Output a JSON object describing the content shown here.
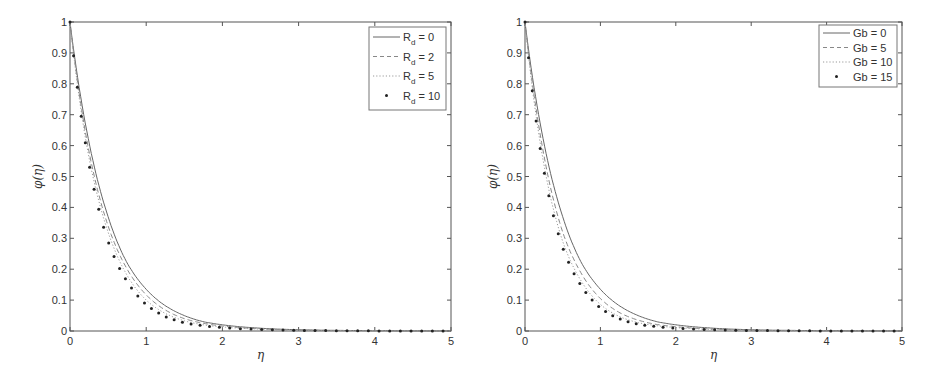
{
  "chart_data": [
    {
      "type": "line",
      "title": "",
      "xlabel": "η",
      "ylabel": "φ(η)",
      "xlim": [
        0,
        5
      ],
      "ylim": [
        0,
        1
      ],
      "xticks": [
        "0",
        "1",
        "2",
        "3",
        "4",
        "5"
      ],
      "yticks": [
        "0",
        "0.1",
        "0.2",
        "0.3",
        "0.4",
        "0.5",
        "0.6",
        "0.7",
        "0.8",
        "0.9",
        "1"
      ],
      "grid": false,
      "legend_position": "upper right",
      "x": [
        0,
        0.25,
        0.5,
        0.75,
        1,
        1.25,
        1.5,
        1.75,
        2,
        2.5,
        3,
        3.5,
        4,
        4.5,
        5
      ],
      "series": [
        {
          "name": "R_d = 0",
          "label_main": "R",
          "label_sub": "d",
          "label_rest": " = 0",
          "style": "solid",
          "values": [
            1,
            0.61,
            0.37,
            0.22,
            0.135,
            0.082,
            0.05,
            0.03,
            0.02,
            0.009,
            0.004,
            0.002,
            0.001,
            0.0005,
            0.0002
          ]
        },
        {
          "name": "R_d = 2",
          "label_main": "R",
          "label_sub": "d",
          "label_rest": " = 2",
          "style": "dashed",
          "values": [
            1,
            0.58,
            0.34,
            0.2,
            0.117,
            0.068,
            0.04,
            0.025,
            0.016,
            0.007,
            0.003,
            0.0015,
            0.0007,
            0.0003,
            0.0001
          ]
        },
        {
          "name": "R_d = 5",
          "label_main": "R",
          "label_sub": "d",
          "label_rest": " = 5",
          "style": "dotted",
          "values": [
            1,
            0.56,
            0.32,
            0.18,
            0.1,
            0.057,
            0.033,
            0.02,
            0.013,
            0.006,
            0.0025,
            0.0012,
            0.0005,
            0.0002,
            0.0001
          ]
        },
        {
          "name": "R_d = 10",
          "label_main": "R",
          "label_sub": "d",
          "label_rest": " = 10",
          "style": "markers",
          "values": [
            1,
            0.54,
            0.29,
            0.16,
            0.086,
            0.047,
            0.027,
            0.017,
            0.011,
            0.005,
            0.002,
            0.001,
            0.0004,
            0.0002,
            0.0001
          ]
        }
      ]
    },
    {
      "type": "line",
      "title": "",
      "xlabel": "η",
      "ylabel": "φ(η)",
      "xlim": [
        0,
        5
      ],
      "ylim": [
        0,
        1
      ],
      "xticks": [
        "0",
        "1",
        "2",
        "3",
        "4",
        "5"
      ],
      "yticks": [
        "0",
        "0.1",
        "0.2",
        "0.3",
        "0.4",
        "0.5",
        "0.6",
        "0.7",
        "0.8",
        "0.9",
        "1"
      ],
      "grid": false,
      "legend_position": "upper right",
      "x": [
        0,
        0.25,
        0.5,
        0.75,
        1,
        1.25,
        1.5,
        1.75,
        2,
        2.5,
        3,
        3.5,
        4,
        4.5,
        5
      ],
      "series": [
        {
          "name": "Gb = 0",
          "label_main": "Gb = 0",
          "label_sub": "",
          "label_rest": "",
          "style": "solid",
          "values": [
            1,
            0.61,
            0.37,
            0.22,
            0.135,
            0.082,
            0.05,
            0.03,
            0.02,
            0.009,
            0.004,
            0.002,
            0.001,
            0.0005,
            0.0002
          ]
        },
        {
          "name": "Gb = 5",
          "label_main": "Gb = 5",
          "label_sub": "",
          "label_rest": "",
          "style": "dashed",
          "values": [
            1,
            0.57,
            0.32,
            0.185,
            0.105,
            0.06,
            0.035,
            0.021,
            0.014,
            0.006,
            0.0025,
            0.0012,
            0.0005,
            0.0002,
            0.0001
          ]
        },
        {
          "name": "Gb = 10",
          "label_main": "Gb = 10",
          "label_sub": "",
          "label_rest": "",
          "style": "dotted",
          "values": [
            1,
            0.54,
            0.29,
            0.16,
            0.086,
            0.047,
            0.027,
            0.017,
            0.011,
            0.005,
            0.002,
            0.001,
            0.0004,
            0.0002,
            0.0001
          ]
        },
        {
          "name": "Gb = 15",
          "label_main": "Gb = 15",
          "label_sub": "",
          "label_rest": "",
          "style": "markers",
          "values": [
            1,
            0.52,
            0.27,
            0.145,
            0.075,
            0.04,
            0.022,
            0.014,
            0.009,
            0.004,
            0.0018,
            0.0008,
            0.0003,
            0.0001,
            0.0001
          ]
        }
      ]
    }
  ],
  "panels": [
    {
      "ylabel": "φ(η)",
      "xlabel": "η"
    },
    {
      "ylabel": "φ(η)",
      "xlabel": "η"
    }
  ],
  "colors": {
    "axis": "#555555",
    "line": "#666666",
    "marker": "#222222",
    "legend_border": "#777777"
  }
}
